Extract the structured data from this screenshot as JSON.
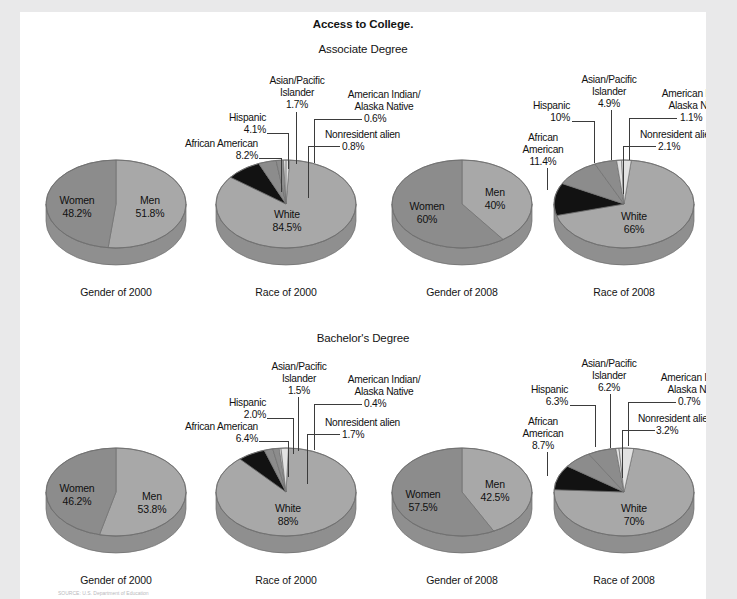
{
  "page": {
    "title": "Access to College.",
    "sections": [
      {
        "id": "associate",
        "heading": "Associate Degree"
      },
      {
        "id": "bachelor",
        "heading": "Bachelor's Degree"
      }
    ],
    "footnote": "SOURCE: U.S. Department of Education"
  },
  "colors": {
    "white_slice": "#c9c9c9",
    "mid_slice": "#a8a8a8",
    "dark_slice": "#8c8c8c",
    "black_slice": "#121212",
    "light_slice": "#e2e2e2",
    "rim": "#8f8f8f",
    "outline": "#6f6f6f",
    "page_bg": "#ffffff",
    "canvas_bg": "#e9e9ea",
    "text": "#141414"
  },
  "chart_data": [
    {
      "id": "assoc-gender-2000",
      "type": "pie",
      "title": "Gender of 2000",
      "section": "Associate Degree",
      "categories": [
        "Men",
        "Women"
      ],
      "values": [
        51.8,
        48.2
      ],
      "labels": [
        {
          "name": "Men",
          "value": "51.8%"
        },
        {
          "name": "Women",
          "value": "48.2%"
        }
      ]
    },
    {
      "id": "assoc-race-2000",
      "type": "pie",
      "title": "Race of 2000",
      "section": "Associate Degree",
      "categories": [
        "White",
        "African American",
        "Hispanic",
        "Asian/Pacific Islander",
        "American Indian/Alaska Native",
        "Nonresident alien"
      ],
      "values": [
        84.5,
        8.2,
        4.1,
        1.7,
        0.6,
        0.8
      ],
      "labels": [
        {
          "name": "White",
          "value": "84.5%"
        },
        {
          "name": "African American",
          "value": "8.2%"
        },
        {
          "name": "Hispanic",
          "value": "4.1%"
        },
        {
          "name": "Asian/Pacific Islander",
          "value": "1.7%"
        },
        {
          "name": "American Indian/ Alaska Native",
          "value": "0.6%"
        },
        {
          "name": "Nonresident alien",
          "value": "0.8%"
        }
      ]
    },
    {
      "id": "assoc-gender-2008",
      "type": "pie",
      "title": "Gender of 2008",
      "section": "Associate Degree",
      "categories": [
        "Men",
        "Women"
      ],
      "values": [
        40,
        60
      ],
      "labels": [
        {
          "name": "Men",
          "value": "40%"
        },
        {
          "name": "Women",
          "value": "60%"
        }
      ]
    },
    {
      "id": "assoc-race-2008",
      "type": "pie",
      "title": "Race of 2008",
      "section": "Associate Degree",
      "categories": [
        "White",
        "African American",
        "Hispanic",
        "Asian/Pacific Islander",
        "American Indian/Alaska Native",
        "Nonresident alien"
      ],
      "values": [
        66,
        11.4,
        10,
        4.9,
        1.1,
        2.1
      ],
      "labels": [
        {
          "name": "White",
          "value": "66%"
        },
        {
          "name": "African American",
          "value": "11.4%"
        },
        {
          "name": "Hispanic",
          "value": "10%"
        },
        {
          "name": "Asian/Pacific Islander",
          "value": "4.9%"
        },
        {
          "name": "American Indian/ Alaska Native",
          "value": "1.1%"
        },
        {
          "name": "Nonresident alien",
          "value": "2.1%"
        }
      ]
    },
    {
      "id": "bach-gender-2000",
      "type": "pie",
      "title": "Gender of 2000",
      "section": "Bachelor's Degree",
      "categories": [
        "Men",
        "Women"
      ],
      "values": [
        53.8,
        46.2
      ],
      "labels": [
        {
          "name": "Men",
          "value": "53.8%"
        },
        {
          "name": "Women",
          "value": "46.2%"
        }
      ]
    },
    {
      "id": "bach-race-2000",
      "type": "pie",
      "title": "Race of 2000",
      "section": "Bachelor's Degree",
      "categories": [
        "White",
        "African American",
        "Hispanic",
        "Asian/Pacific Islander",
        "American Indian/Alaska Native",
        "Nonresident alien"
      ],
      "values": [
        88,
        6.4,
        2.0,
        1.5,
        0.4,
        1.7
      ],
      "labels": [
        {
          "name": "White",
          "value": "88%"
        },
        {
          "name": "African American",
          "value": "6.4%"
        },
        {
          "name": "Hispanic",
          "value": "2.0%"
        },
        {
          "name": "Asian/Pacific Islander",
          "value": "1.5%"
        },
        {
          "name": "American Indian/ Alaska Native",
          "value": "0.4%"
        },
        {
          "name": "Nonresident alien",
          "value": "1.7%"
        }
      ]
    },
    {
      "id": "bach-gender-2008",
      "type": "pie",
      "title": "Gender of 2008",
      "section": "Bachelor's Degree",
      "categories": [
        "Men",
        "Women"
      ],
      "values": [
        42.5,
        57.5
      ],
      "labels": [
        {
          "name": "Men",
          "value": "42.5%"
        },
        {
          "name": "Women",
          "value": "57.5%"
        }
      ]
    },
    {
      "id": "bach-race-2008",
      "type": "pie",
      "title": "Race of 2008",
      "section": "Bachelor's Degree",
      "categories": [
        "White",
        "African American",
        "Hispanic",
        "Asian/Pacific Islander",
        "American Indian/Alaska Native",
        "Nonresident alien"
      ],
      "values": [
        70,
        8.7,
        6.3,
        6.2,
        0.7,
        3.2
      ],
      "labels": [
        {
          "name": "White",
          "value": "70%"
        },
        {
          "name": "African American",
          "value": "8.7%"
        },
        {
          "name": "Hispanic",
          "value": "6.3%"
        },
        {
          "name": "Asian/Pacific Islander",
          "value": "6.2%"
        },
        {
          "name": "American Indian/ Alaska Native",
          "value": "0.7%"
        },
        {
          "name": "Nonresident alien",
          "value": "3.2%"
        }
      ]
    }
  ],
  "text": {
    "assoc_gender2000": {
      "cap": "Gender of 2000",
      "men_n": "Men",
      "men_v": "51.8%",
      "women_n": "Women",
      "women_v": "48.2%"
    },
    "assoc_race2000": {
      "cap": "Race of 2000",
      "white_n": "White",
      "white_v": "84.5%",
      "aa_n": "African American",
      "aa_v": "8.2%",
      "hisp_n": "Hispanic",
      "hisp_v": "4.1%",
      "api_n1": "Asian/Pacific",
      "api_n2": "Islander",
      "api_v": "1.7%",
      "ai_n1": "American Indian/",
      "ai_n2": "Alaska Native",
      "ai_v": "0.6%",
      "nra_n": "Nonresident alien",
      "nra_v": "0.8%"
    },
    "assoc_gender2008": {
      "cap": "Gender of 2008",
      "men_n": "Men",
      "men_v": "40%",
      "women_n": "Women",
      "women_v": "60%"
    },
    "assoc_race2008": {
      "cap": "Race of 2008",
      "white_n": "White",
      "white_v": "66%",
      "aa_n1": "African",
      "aa_n2": "American",
      "aa_v": "11.4%",
      "hisp_n": "Hispanic",
      "hisp_v": "10%",
      "api_n1": "Asian/Pacific",
      "api_n2": "Islander",
      "api_v": "4.9%",
      "ai_n1": "American Indian/",
      "ai_n2": "Alaska Native",
      "ai_v": "1.1%",
      "nra_n": "Nonresident alien",
      "nra_v": "2.1%"
    },
    "bach_gender2000": {
      "cap": "Gender of 2000",
      "men_n": "Men",
      "men_v": "53.8%",
      "women_n": "Women",
      "women_v": "46.2%"
    },
    "bach_race2000": {
      "cap": "Race of 2000",
      "white_n": "White",
      "white_v": "88%",
      "aa_n": "African American",
      "aa_v": "6.4%",
      "hisp_n": "Hispanic",
      "hisp_v": "2.0%",
      "api_n1": "Asian/Pacific",
      "api_n2": "Islander",
      "api_v": "1.5%",
      "ai_n1": "American Indian/",
      "ai_n2": "Alaska Native",
      "ai_v": "0.4%",
      "nra_n": "Nonresident alien",
      "nra_v": "1.7%"
    },
    "bach_gender2008": {
      "cap": "Gender of 2008",
      "men_n": "Men",
      "men_v": "42.5%",
      "women_n": "Women",
      "women_v": "57.5%"
    },
    "bach_race2008": {
      "cap": "Race of 2008",
      "white_n": "White",
      "white_v": "70%",
      "aa_n1": "African",
      "aa_n2": "American",
      "aa_v": "8.7%",
      "hisp_n": "Hispanic",
      "hisp_v": "6.3%",
      "api_n1": "Asian/Pacific",
      "api_n2": "Islander",
      "api_v": "6.2%",
      "ai_n1": "American Indian/",
      "ai_n2": "Alaska Native",
      "ai_v": "0.7%",
      "nra_n": "Nonresident alien",
      "nra_v": "3.2%"
    }
  }
}
